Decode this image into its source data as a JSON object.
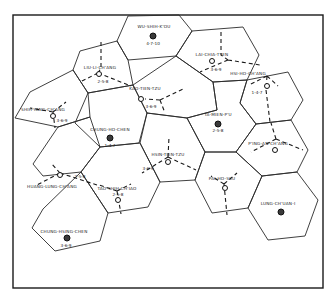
{
  "diagram": {
    "type": "hexagonal market-area map",
    "centers": [
      {
        "name": "WU-SHIH-K'OU",
        "code": "4-7-10",
        "kind": "major"
      },
      {
        "name": "LAI-CHIA-T'IEN",
        "code": "3-6-9",
        "kind": "minor"
      },
      {
        "name": "LIU-LI-CH'ANG",
        "code": "2-5-8",
        "kind": "minor"
      },
      {
        "name": "KAO-TIEN-TZU",
        "code": "3-6-9",
        "kind": "minor"
      },
      {
        "name": "HSI-HO-CH'ANG",
        "code": "1-4-7",
        "kind": "minor"
      },
      {
        "name": "SHIH-YANG-CH'ANG",
        "code": "3-6-9",
        "kind": "minor"
      },
      {
        "name": "CHUNG-HO-CHEN",
        "code": "1-4-7",
        "kind": "major"
      },
      {
        "name": "TA-MIEN-P'U",
        "code": "2-5-8",
        "kind": "major"
      },
      {
        "name": "HSIN-TIEN-TZU",
        "code": "3-6-9",
        "kind": "minor"
      },
      {
        "name": "P'ING-AN-CH'ANG",
        "code": "",
        "kind": "minor"
      },
      {
        "name": "HUANG-LUNG-CH'ANG",
        "code": "2-5-8",
        "kind": "minor"
      },
      {
        "name": "TAO-SHIH-CH'IAO",
        "code": "2-5-8",
        "kind": "minor"
      },
      {
        "name": "PAI-HO-SSU",
        "code": "",
        "kind": "minor"
      },
      {
        "name": "CHUNG-HSING-CHEN",
        "code": "3-6-9",
        "kind": "major"
      },
      {
        "name": "LUNG-CH'UAN-I",
        "code": "",
        "kind": "major"
      }
    ]
  }
}
